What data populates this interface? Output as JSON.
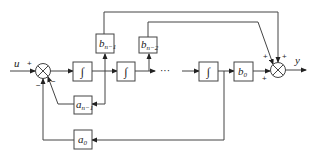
{
  "diagram": {
    "type": "block-diagram",
    "input_label": "u",
    "output_label": "y",
    "integrator_symbol": "∫",
    "ellipsis": "···",
    "blocks": {
      "b_n1": {
        "main": "b",
        "sub": "n−1"
      },
      "b_n2": {
        "main": "b",
        "sub": "n−2"
      },
      "b_0": {
        "main": "b",
        "sub": "0"
      },
      "a_n1": {
        "main": "a",
        "sub": "n−1"
      },
      "a_0": {
        "main": "a",
        "sub": "0"
      }
    },
    "input_sum_signs": {
      "u": "+",
      "a0": "−",
      "an1": "−"
    },
    "output_sum_signs": {
      "bn2": "+",
      "bn1": "+",
      "b0": "+"
    }
  }
}
